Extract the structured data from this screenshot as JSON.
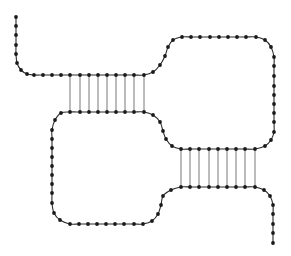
{
  "diagram": {
    "type": "nucleic-acid-secondary-structure",
    "colors": {
      "background": "#ffffff",
      "backbone": "#2a2a2a",
      "bead": "#1a1a1a",
      "pair": "#555555"
    },
    "bead_radius": 1.9,
    "backbone_nodes": [
      [
        16,
        17
      ],
      [
        16,
        26
      ],
      [
        16,
        35
      ],
      [
        16,
        45
      ],
      [
        16,
        54
      ],
      [
        17,
        63
      ],
      [
        21,
        70
      ],
      [
        27,
        74
      ],
      [
        34,
        75
      ],
      [
        43,
        75
      ],
      [
        52,
        75
      ],
      [
        61,
        75
      ],
      [
        70,
        75
      ],
      [
        80,
        75
      ],
      [
        89,
        75
      ],
      [
        98,
        75
      ],
      [
        107,
        75
      ],
      [
        116,
        75
      ],
      [
        125,
        75
      ],
      [
        134,
        75
      ],
      [
        144,
        75
      ],
      [
        153,
        72
      ],
      [
        160,
        65
      ],
      [
        165,
        56
      ],
      [
        168,
        47
      ],
      [
        173,
        40
      ],
      [
        182,
        37
      ],
      [
        191,
        37
      ],
      [
        200,
        37
      ],
      [
        210,
        37
      ],
      [
        219,
        37
      ],
      [
        228,
        37
      ],
      [
        237,
        37
      ],
      [
        246,
        37
      ],
      [
        256,
        37
      ],
      [
        265,
        40
      ],
      [
        271,
        47
      ],
      [
        274,
        57
      ],
      [
        274,
        66
      ],
      [
        274,
        76
      ],
      [
        274,
        86
      ],
      [
        274,
        95
      ],
      [
        274,
        104
      ],
      [
        274,
        113
      ],
      [
        274,
        122
      ],
      [
        274,
        132
      ],
      [
        271,
        140
      ],
      [
        265,
        146
      ],
      [
        255,
        149
      ],
      [
        245,
        149
      ],
      [
        236,
        149
      ],
      [
        227,
        149
      ],
      [
        218,
        149
      ],
      [
        209,
        149
      ],
      [
        199,
        149
      ],
      [
        190,
        149
      ],
      [
        181,
        149
      ],
      [
        172,
        146
      ],
      [
        166,
        139
      ],
      [
        163,
        131
      ],
      [
        160,
        122
      ],
      [
        153,
        115
      ],
      [
        144,
        112
      ],
      [
        134,
        112
      ],
      [
        125,
        112
      ],
      [
        116,
        112
      ],
      [
        107,
        112
      ],
      [
        98,
        112
      ],
      [
        89,
        112
      ],
      [
        80,
        112
      ],
      [
        70,
        112
      ],
      [
        61,
        113
      ],
      [
        55,
        120
      ],
      [
        52,
        130
      ],
      [
        52,
        139
      ],
      [
        52,
        148
      ],
      [
        52,
        157
      ],
      [
        52,
        166
      ],
      [
        52,
        175
      ],
      [
        52,
        184
      ],
      [
        52,
        193
      ],
      [
        52,
        203
      ],
      [
        54,
        213
      ],
      [
        60,
        220
      ],
      [
        70,
        224
      ],
      [
        79,
        224
      ],
      [
        88,
        224
      ],
      [
        97,
        224
      ],
      [
        106,
        224
      ],
      [
        115,
        224
      ],
      [
        124,
        224
      ],
      [
        134,
        224
      ],
      [
        143,
        224
      ],
      [
        152,
        221
      ],
      [
        158,
        214
      ],
      [
        161,
        205
      ],
      [
        163,
        196
      ],
      [
        171,
        190
      ],
      [
        181,
        187
      ],
      [
        190,
        187
      ],
      [
        199,
        187
      ],
      [
        209,
        187
      ],
      [
        218,
        187
      ],
      [
        227,
        187
      ],
      [
        236,
        187
      ],
      [
        245,
        187
      ],
      [
        255,
        187
      ],
      [
        264,
        190
      ],
      [
        270,
        196
      ],
      [
        273,
        205
      ],
      [
        273,
        214
      ],
      [
        273,
        224
      ],
      [
        273,
        233
      ],
      [
        273,
        243
      ]
    ],
    "base_pairs": [
      {
        "stem": "upper",
        "x": [
          70,
          80,
          89,
          98,
          107,
          116,
          125,
          134,
          144
        ],
        "y1": 75,
        "y2": 112
      },
      {
        "stem": "lower",
        "x": [
          181,
          190,
          199,
          209,
          218,
          227,
          236,
          245,
          255
        ],
        "y1": 149,
        "y2": 187
      }
    ],
    "labels": {
      "title": "Secondary structure diagram",
      "upper_stem": "Upper stem (9 base pairs)",
      "lower_stem": "Lower stem (9 base pairs)",
      "left_loop": "Left loop",
      "right_loop": "Right loop"
    }
  }
}
